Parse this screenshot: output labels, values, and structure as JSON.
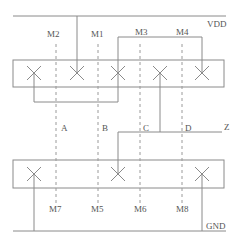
{
  "diagram": {
    "type": "transistor layout / stick diagram",
    "rails": {
      "top": {
        "label": "VDD",
        "y": 16
      },
      "bottom": {
        "label": "GND",
        "y": 231
      }
    },
    "output": {
      "label": "Z"
    },
    "top_transistors": [
      "M2",
      "M1",
      "M3",
      "M4"
    ],
    "bottom_transistors": [
      "M7",
      "M5",
      "M6",
      "M8"
    ],
    "inputs": [
      "A",
      "B",
      "C",
      "D"
    ],
    "colors": {
      "line": "#8a8a8a",
      "text": "#555555",
      "background": "#ffffff"
    }
  }
}
